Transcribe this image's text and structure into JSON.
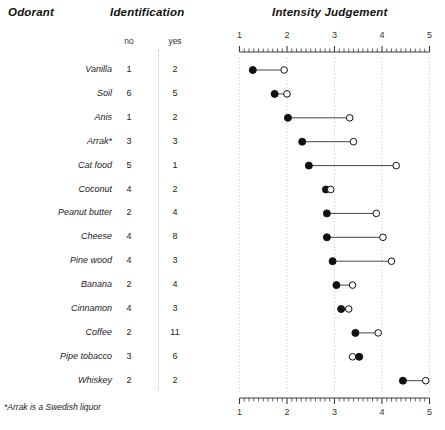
{
  "header": {
    "odorant": "Odorant",
    "identification": "Identification",
    "intensity": "Intensity Judgement",
    "sub_no": "no",
    "sub_yes": "yes"
  },
  "footnote": "*Arrak is a Swedish liquor",
  "axis": {
    "min": 1,
    "max": 5,
    "ticks": [
      "1",
      "2",
      "3",
      "4",
      "5"
    ],
    "minor_per_major": 10,
    "top_axis": true,
    "bottom_axis": true
  },
  "colors": {
    "text": "#1a1a1a",
    "gridline": "#c9c9c9",
    "axis": "#3a3a3a",
    "filled_marker": "#111111",
    "open_marker": "#ffffff",
    "connector": "#444444"
  },
  "chart_data": {
    "type": "scatter",
    "title": "Intensity Judgement",
    "xlabel": "",
    "ylabel": "Odorant",
    "xlim": [
      1,
      5
    ],
    "grid": true,
    "legend": [
      {
        "name": "identified (filled)",
        "marker": "filled-circle"
      },
      {
        "name": "not identified (open)",
        "marker": "open-circle"
      }
    ],
    "categories": [
      "Vanilla",
      "Soil",
      "Anis",
      "Arrak*",
      "Cat food",
      "Coconut",
      "Peanut butter",
      "Cheese",
      "Pine wood",
      "Banana",
      "Cinnamon",
      "Coffee",
      "Pipe tobacco",
      "Whiskey"
    ],
    "series": [
      {
        "name": "filled",
        "values": [
          1.28,
          1.74,
          2.02,
          2.32,
          2.46,
          2.82,
          2.84,
          2.84,
          2.96,
          3.04,
          3.14,
          3.44,
          3.52,
          4.44
        ]
      },
      {
        "name": "open",
        "values": [
          1.94,
          2.0,
          3.32,
          3.4,
          4.3,
          2.92,
          3.88,
          4.02,
          4.2,
          3.38,
          3.3,
          3.92,
          3.38,
          4.92
        ]
      }
    ]
  },
  "table": {
    "columns": [
      "Odorant",
      "no",
      "yes"
    ],
    "rows": [
      {
        "odorant": "Vanilla",
        "no": "1",
        "yes": "2",
        "filled": 1.28,
        "open": 1.94
      },
      {
        "odorant": "Soil",
        "no": "6",
        "yes": "5",
        "filled": 1.74,
        "open": 2.0
      },
      {
        "odorant": "Anis",
        "no": "1",
        "yes": "2",
        "filled": 2.02,
        "open": 3.32
      },
      {
        "odorant": "Arrak*",
        "no": "3",
        "yes": "3",
        "filled": 2.32,
        "open": 3.4
      },
      {
        "odorant": "Cat food",
        "no": "5",
        "yes": "1",
        "filled": 2.46,
        "open": 4.3
      },
      {
        "odorant": "Coconut",
        "no": "4",
        "yes": "2",
        "filled": 2.82,
        "open": 2.92
      },
      {
        "odorant": "Peanut butter",
        "no": "2",
        "yes": "4",
        "filled": 2.84,
        "open": 3.88
      },
      {
        "odorant": "Cheese",
        "no": "4",
        "yes": "8",
        "filled": 2.84,
        "open": 4.02
      },
      {
        "odorant": "Pine wood",
        "no": "4",
        "yes": "3",
        "filled": 2.96,
        "open": 4.2
      },
      {
        "odorant": "Banana",
        "no": "2",
        "yes": "4",
        "filled": 3.04,
        "open": 3.38
      },
      {
        "odorant": "Cinnamon",
        "no": "4",
        "yes": "3",
        "filled": 3.14,
        "open": 3.3
      },
      {
        "odorant": "Coffee",
        "no": "2",
        "yes": "11",
        "filled": 3.44,
        "open": 3.92
      },
      {
        "odorant": "Pipe tobacco",
        "no": "3",
        "yes": "6",
        "filled": 3.52,
        "open": 3.38
      },
      {
        "odorant": "Whiskey",
        "no": "2",
        "yes": "2",
        "filled": 4.44,
        "open": 4.92
      }
    ]
  }
}
